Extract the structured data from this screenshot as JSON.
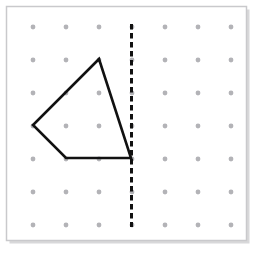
{
  "figure": {
    "canvas": {
      "width": 256,
      "height": 254,
      "background": "#ffffff"
    },
    "board": {
      "name": "geoboard-frame",
      "x": 6.5,
      "y": 6.5,
      "width": 240,
      "height": 234,
      "fill": "#ffffff",
      "border_color": "#c9c9cc",
      "border_width": 1.5,
      "shadow_color": "#d8d8da",
      "shadow_offset": 3
    },
    "grid": {
      "name": "peg-dot-grid",
      "columns": 7,
      "rows": 7,
      "origin_x": 33,
      "origin_y": 27,
      "spacing_x": 33,
      "spacing_y": 33,
      "dot_radius": 2.4,
      "dot_color": "#b3b3b7",
      "x_positions": [
        33,
        66,
        99,
        132,
        165,
        198,
        231
      ],
      "y_positions": [
        27,
        60,
        93,
        126,
        159,
        192,
        225
      ]
    },
    "mirror_line": {
      "name": "line-of-reflection",
      "orientation": "vertical",
      "x": 131.5,
      "y_start": 24,
      "y_end": 227,
      "color": "#111111",
      "stroke_width": 3,
      "dash_length": 5.5,
      "gap_length": 3.5,
      "label": "line of reflection"
    },
    "shape": {
      "name": "quadrilateral",
      "sides": 4,
      "color": "#111111",
      "stroke_width": 2.6,
      "fill": "none",
      "closed": true,
      "vertices": [
        {
          "name": "top-vertex",
          "x": 99,
          "y": 59,
          "grid_col": 3,
          "grid_row": 2
        },
        {
          "name": "right-vertex",
          "x": 131,
          "y": 158,
          "grid_col": 4,
          "grid_row": 5
        },
        {
          "name": "bottom-left-vertex",
          "x": 66,
          "y": 158,
          "grid_col": 2,
          "grid_row": 5
        },
        {
          "name": "left-vertex",
          "x": 33,
          "y": 125,
          "grid_col": 1,
          "grid_row": 4
        }
      ],
      "path": "M 99 59 L 131 158 L 66 158 L 33 125 Z"
    }
  },
  "chart_data": {
    "type": "scatter",
    "xlabel": "",
    "ylabel": "",
    "xlim": [
      0,
      8
    ],
    "ylim": [
      0,
      8
    ],
    "grid": true,
    "legend": "none",
    "series": [
      {
        "name": "peg-grid",
        "kind": "points",
        "x": [
          1,
          2,
          3,
          4,
          5,
          6,
          7,
          1,
          2,
          3,
          4,
          5,
          6,
          7,
          1,
          2,
          3,
          4,
          5,
          6,
          7,
          1,
          2,
          3,
          4,
          5,
          6,
          7,
          1,
          2,
          3,
          4,
          5,
          6,
          7,
          1,
          2,
          3,
          4,
          5,
          6,
          7,
          1,
          2,
          3,
          4,
          5,
          6,
          7
        ],
        "y": [
          7,
          7,
          7,
          7,
          7,
          7,
          7,
          6,
          6,
          6,
          6,
          6,
          6,
          6,
          5,
          5,
          5,
          5,
          5,
          5,
          5,
          4,
          4,
          4,
          4,
          4,
          4,
          4,
          3,
          3,
          3,
          3,
          3,
          3,
          3,
          2,
          2,
          2,
          2,
          2,
          2,
          2,
          1,
          1,
          1,
          1,
          1,
          1,
          1
        ],
        "color": "#b3b3b7"
      },
      {
        "name": "quadrilateral",
        "kind": "closed-polyline",
        "x": [
          3,
          4,
          2,
          1,
          3
        ],
        "y": [
          6,
          3,
          3,
          4,
          6
        ],
        "color": "#111111"
      },
      {
        "name": "line-of-reflection",
        "kind": "dashed-vline",
        "x": [
          4,
          4
        ],
        "y": [
          7.1,
          0.9
        ],
        "color": "#111111"
      }
    ]
  }
}
